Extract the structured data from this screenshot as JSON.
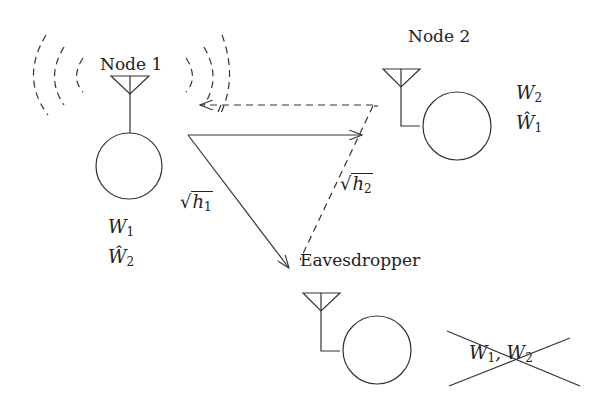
{
  "diagram": {
    "nodes": [
      {
        "id": "node1",
        "label": "Node 1",
        "sends": "W",
        "sends_sub": "1",
        "decodes": "Ŵ",
        "decodes_sub": "2",
        "transmitting": true
      },
      {
        "id": "node2",
        "label": "Node 2",
        "sends": "W",
        "sends_sub": "2",
        "decodes": "Ŵ",
        "decodes_sub": "1"
      },
      {
        "id": "eve",
        "label": "Eavesdropper",
        "crossed_out": "W₁, W₂",
        "crossed_a": "W",
        "crossed_a_sub": "1",
        "crossed_b": "W",
        "crossed_b_sub": "2"
      }
    ],
    "edges": [
      {
        "from": "node1",
        "to": "node2",
        "style": "solid"
      },
      {
        "from": "node1",
        "to": "eve",
        "style": "solid",
        "label": "√h₁",
        "label_var": "h",
        "label_sub": "1"
      },
      {
        "from": "node2",
        "to": "eve",
        "style": "dashed",
        "label": "√h₂",
        "label_var": "h",
        "label_sub": "2"
      },
      {
        "from": "node2",
        "to": "node1",
        "style": "dashed"
      }
    ]
  }
}
